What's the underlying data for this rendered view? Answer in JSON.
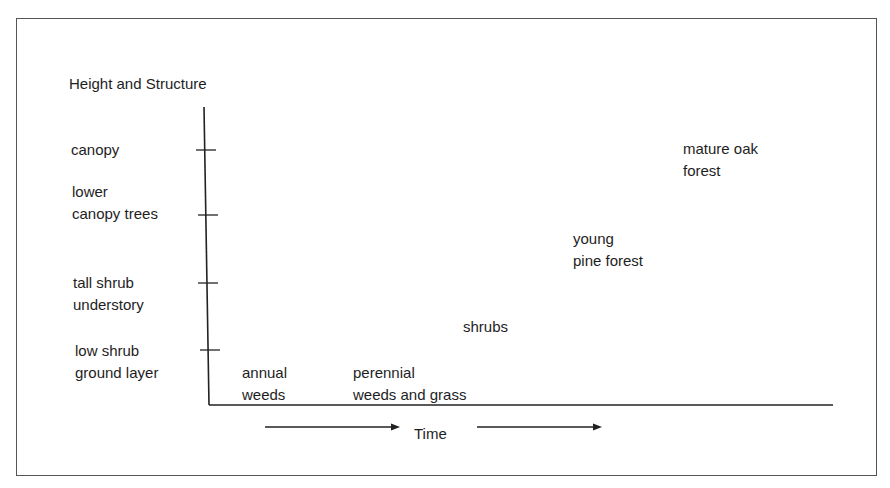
{
  "diagram": {
    "y_axis_title": "Height and Structure",
    "x_axis_label": "Time",
    "y_levels": [
      {
        "label": "canopy"
      },
      {
        "label": "lower\ncanopy trees"
      },
      {
        "label": "tall shrub\nunderstory"
      },
      {
        "label": "low shrub\nground layer"
      }
    ],
    "stages": [
      {
        "label": "annual\nweeds"
      },
      {
        "label": "perennial\nweeds and grass"
      },
      {
        "label": "shrubs"
      },
      {
        "label": "young\npine forest"
      },
      {
        "label": "mature oak\nforest"
      }
    ]
  },
  "colors": {
    "line": "#222222",
    "frame": "#555555",
    "text": "#1e1e1e"
  }
}
